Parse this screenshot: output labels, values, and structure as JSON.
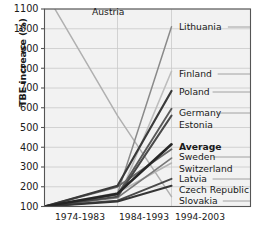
{
  "chart_data": {
    "type": "line",
    "title": "",
    "xlabel": "",
    "ylabel": "TBE increase (%)",
    "categories": [
      "1974-1983",
      "1984-1993",
      "1994-2003"
    ],
    "ylim": [
      100,
      1100
    ],
    "yticks": [
      100,
      200,
      300,
      400,
      500,
      600,
      700,
      800,
      900,
      1000,
      1100
    ],
    "grid": true,
    "legend_position": "right-inline",
    "series": [
      {
        "name": "Austria",
        "values": [
          1190,
          560,
          150
        ],
        "color": "#b0b0b0",
        "width": 1.5,
        "bold": false
      },
      {
        "name": "Lithuania",
        "values": [
          100,
          165,
          1010
        ],
        "color": "#8a8a8a",
        "width": 1.5,
        "bold": false
      },
      {
        "name": "Finland",
        "values": [
          100,
          130,
          785
        ],
        "color": "#bdbdbd",
        "width": 1.6,
        "bold": false
      },
      {
        "name": "Poland",
        "values": [
          100,
          205,
          685
        ],
        "color": "#3a3a3a",
        "width": 2.2,
        "bold": false
      },
      {
        "name": "Germany",
        "values": [
          100,
          160,
          595
        ],
        "color": "#5a5a5a",
        "width": 1.9,
        "bold": false
      },
      {
        "name": "Estonia",
        "values": [
          100,
          150,
          560
        ],
        "color": "#4a4a4a",
        "width": 2.0,
        "bold": false
      },
      {
        "name": "Average",
        "values": [
          100,
          165,
          415
        ],
        "color": "#262626",
        "width": 2.6,
        "bold": true
      },
      {
        "name": "Sweden",
        "values": [
          100,
          200,
          390
        ],
        "color": "#6a6a6a",
        "width": 1.9,
        "bold": false
      },
      {
        "name": "Switzerland",
        "values": [
          100,
          145,
          345
        ],
        "color": "#7a7a7a",
        "width": 1.8,
        "bold": false
      },
      {
        "name": "Latvia",
        "values": [
          100,
          170,
          320
        ],
        "color": "#b5b5b5",
        "width": 1.6,
        "bold": false
      },
      {
        "name": "Czech Republic",
        "values": [
          100,
          130,
          240
        ],
        "color": "#4a4a4a",
        "width": 1.9,
        "bold": false
      },
      {
        "name": "Slovakia",
        "values": [
          100,
          125,
          205
        ],
        "color": "#353535",
        "width": 2.0,
        "bold": false
      }
    ],
    "label_anchors": [
      {
        "name": "Austria",
        "x": 92,
        "y": 15,
        "leader": false,
        "bold": false
      },
      {
        "name": "Lithuania",
        "x": 179,
        "y": 30,
        "leader": true,
        "bold": false
      },
      {
        "name": "Finland",
        "x": 179,
        "y": 77,
        "leader": true,
        "bold": false
      },
      {
        "name": "Poland",
        "x": 179,
        "y": 95,
        "leader": true,
        "bold": false
      },
      {
        "name": "Germany",
        "x": 179,
        "y": 116,
        "leader": true,
        "bold": false
      },
      {
        "name": "Estonia",
        "x": 179,
        "y": 128,
        "leader": false,
        "bold": false
      },
      {
        "name": "Average",
        "x": 179,
        "y": 150,
        "leader": false,
        "bold": true
      },
      {
        "name": "Sweden",
        "x": 179,
        "y": 160,
        "leader": true,
        "bold": false
      },
      {
        "name": "Switzerland",
        "x": 179,
        "y": 172,
        "leader": false,
        "bold": false
      },
      {
        "name": "Latvia",
        "x": 179,
        "y": 182,
        "leader": true,
        "bold": false
      },
      {
        "name": "Czech Republic",
        "x": 179,
        "y": 193,
        "leader": false,
        "bold": false
      },
      {
        "name": "Slovakia",
        "x": 179,
        "y": 204,
        "leader": true,
        "bold": false
      }
    ],
    "colors": {
      "plot_background": "#f2f2f2",
      "gridline": "#c9c9c9",
      "axis": "#555555",
      "text": "#1a1a1a"
    }
  }
}
